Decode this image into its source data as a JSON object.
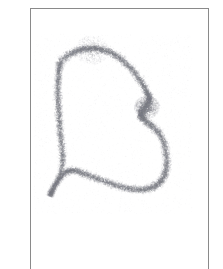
{
  "page": {
    "width": 223,
    "height": 269,
    "background_color": "#ffffff",
    "media": "scanned-paper-sketch",
    "text_content": "none"
  },
  "frame": {
    "name": "page-border-rules",
    "color": "#8a8a8a",
    "stroke_width": 1,
    "lines": [
      {
        "name": "top-rule",
        "x": 30,
        "y": 8,
        "width": 179,
        "height": 1
      },
      {
        "name": "left-rule",
        "x": 30,
        "y": 8,
        "width": 1,
        "height": 261
      },
      {
        "name": "right-rule",
        "x": 208,
        "y": 8,
        "width": 1,
        "height": 261
      }
    ],
    "bottom_rule_present": false
  },
  "artwork": {
    "name": "stippled-flag-outline",
    "technique": "stipple",
    "subject": "flag-banner-silhouette",
    "dot_color": "#7d7f86",
    "dot_count": 14000,
    "dot_radius_min": 0.28,
    "dot_radius_max": 0.72,
    "band_half_width": 7.5,
    "opacity_min": 0.12,
    "opacity_max": 0.62,
    "outline_path": [
      {
        "x": 60,
        "y": 62,
        "density": 0.7,
        "spread": 7.0
      },
      {
        "x": 70,
        "y": 54,
        "density": 0.92,
        "spread": 6.0
      },
      {
        "x": 82,
        "y": 49,
        "density": 1.0,
        "spread": 5.4
      },
      {
        "x": 95,
        "y": 48,
        "density": 1.0,
        "spread": 5.2
      },
      {
        "x": 108,
        "y": 51,
        "density": 0.95,
        "spread": 5.4
      },
      {
        "x": 120,
        "y": 58,
        "density": 0.88,
        "spread": 5.6
      },
      {
        "x": 131,
        "y": 68,
        "density": 0.86,
        "spread": 5.6
      },
      {
        "x": 140,
        "y": 80,
        "density": 0.9,
        "spread": 5.6
      },
      {
        "x": 147,
        "y": 92,
        "density": 1.0,
        "spread": 5.2
      },
      {
        "x": 150,
        "y": 100,
        "density": 1.0,
        "spread": 5.0
      },
      {
        "x": 145,
        "y": 108,
        "density": 1.0,
        "spread": 6.2
      },
      {
        "x": 140,
        "y": 114,
        "density": 1.0,
        "spread": 6.6
      },
      {
        "x": 144,
        "y": 120,
        "density": 0.92,
        "spread": 6.0
      },
      {
        "x": 152,
        "y": 126,
        "density": 0.84,
        "spread": 5.8
      },
      {
        "x": 160,
        "y": 134,
        "density": 0.8,
        "spread": 5.8
      },
      {
        "x": 165,
        "y": 146,
        "density": 0.8,
        "spread": 5.8
      },
      {
        "x": 167,
        "y": 160,
        "density": 0.82,
        "spread": 5.8
      },
      {
        "x": 166,
        "y": 172,
        "density": 0.86,
        "spread": 5.8
      },
      {
        "x": 161,
        "y": 182,
        "density": 0.88,
        "spread": 5.8
      },
      {
        "x": 152,
        "y": 188,
        "density": 0.88,
        "spread": 5.6
      },
      {
        "x": 140,
        "y": 190,
        "density": 0.86,
        "spread": 5.6
      },
      {
        "x": 126,
        "y": 188,
        "density": 0.84,
        "spread": 5.6
      },
      {
        "x": 112,
        "y": 184,
        "density": 0.84,
        "spread": 5.6
      },
      {
        "x": 98,
        "y": 179,
        "density": 0.84,
        "spread": 5.6
      },
      {
        "x": 85,
        "y": 174,
        "density": 0.86,
        "spread": 5.4
      },
      {
        "x": 74,
        "y": 170,
        "density": 0.88,
        "spread": 5.2
      },
      {
        "x": 66,
        "y": 172,
        "density": 0.82,
        "spread": 5.0
      },
      {
        "x": 58,
        "y": 180,
        "density": 0.78,
        "spread": 4.8
      },
      {
        "x": 52,
        "y": 190,
        "density": 0.72,
        "spread": 4.6
      },
      {
        "x": 50,
        "y": 196,
        "density": 0.6,
        "spread": 4.4
      },
      {
        "x": 54,
        "y": 188,
        "density": 0.62,
        "spread": 4.6
      },
      {
        "x": 60,
        "y": 176,
        "density": 0.7,
        "spread": 4.8
      },
      {
        "x": 63,
        "y": 162,
        "density": 0.8,
        "spread": 5.2
      },
      {
        "x": 62,
        "y": 146,
        "density": 0.84,
        "spread": 5.4
      },
      {
        "x": 60,
        "y": 130,
        "density": 0.86,
        "spread": 5.4
      },
      {
        "x": 59,
        "y": 114,
        "density": 0.86,
        "spread": 5.4
      },
      {
        "x": 58,
        "y": 98,
        "density": 0.86,
        "spread": 5.4
      },
      {
        "x": 58,
        "y": 82,
        "density": 0.82,
        "spread": 5.2
      },
      {
        "x": 59,
        "y": 70,
        "density": 0.76,
        "spread": 5.0
      },
      {
        "x": 60,
        "y": 62,
        "density": 0.7,
        "spread": 7.0
      }
    ],
    "dense_clusters": [
      {
        "name": "notch-cluster",
        "x": 147,
        "y": 107,
        "radius": 13,
        "count": 1500,
        "opacity": 0.5
      },
      {
        "name": "top-arc-cluster",
        "x": 92,
        "y": 50,
        "radius": 17,
        "count": 700,
        "opacity": 0.34
      }
    ],
    "haze": {
      "name": "scatter-haze",
      "count": 2600,
      "bounds": {
        "x": 34,
        "y": 34,
        "width": 158,
        "height": 180
      },
      "opacity": 0.1
    }
  }
}
